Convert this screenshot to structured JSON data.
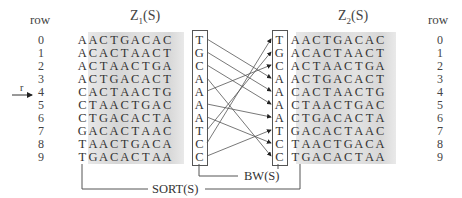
{
  "labels": {
    "row_left": "row",
    "row_right": "row",
    "z1_title": "Z",
    "z1_sub": "1",
    "z1_suffix": "(S)",
    "z2_title": "Z",
    "z2_sub": "2",
    "z2_suffix": "(S)",
    "r_marker": "r",
    "bw": "BW(S)",
    "sort": "SORT(S)"
  },
  "row_numbers": [
    "0",
    "1",
    "2",
    "3",
    "4",
    "5",
    "6",
    "7",
    "8",
    "9"
  ],
  "z1": {
    "rows": [
      "AACTGACAC",
      "ACACTAACT",
      "ACTAACTGA",
      "ACTGACACT",
      "CACTAACTG",
      "CTAACTGAC",
      "CTGACACTA",
      "GACACTAAC",
      "TAACTGACA",
      "TGACACTAA"
    ],
    "last_column": [
      "T",
      "G",
      "C",
      "A",
      "A",
      "A",
      "A",
      "T",
      "C",
      "C"
    ]
  },
  "z2": {
    "first_column": [
      "T",
      "G",
      "C",
      "A",
      "A",
      "A",
      "A",
      "T",
      "C",
      "C"
    ],
    "rows": [
      "AACTGACAC",
      "ACACTAACT",
      "ACTAACTGA",
      "ACTGACACT",
      "CACTAACTG",
      "CTAACTGAC",
      "CTGACACTA",
      "GACACTAAC",
      "TAACTGACA",
      "TGACACTAA"
    ]
  },
  "arrows": [
    [
      0,
      3
    ],
    [
      1,
      4
    ],
    [
      2,
      5
    ],
    [
      3,
      9
    ],
    [
      4,
      2
    ],
    [
      5,
      6
    ],
    [
      6,
      8
    ],
    [
      7,
      1
    ],
    [
      8,
      0
    ],
    [
      9,
      7
    ]
  ],
  "marked_row": 4
}
